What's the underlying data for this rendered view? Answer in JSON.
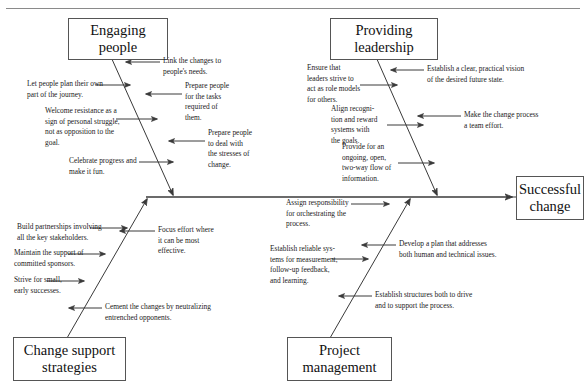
{
  "diagram": {
    "type": "fishbone-ishikawa",
    "effect": {
      "label": "Successful\nchange",
      "line1": "Successful",
      "line2": "change"
    },
    "categories": [
      {
        "id": "engaging-people",
        "label_line1": "Engaging",
        "label_line2": "people",
        "position": "top-left"
      },
      {
        "id": "providing-leadership",
        "label_line1": "Providing",
        "label_line2": "leadership",
        "position": "top-right"
      },
      {
        "id": "change-support-strategies",
        "label_line1": "Change support",
        "label_line2": "strategies",
        "position": "bottom-left"
      },
      {
        "id": "project-management",
        "label_line1": "Project",
        "label_line2": "management",
        "position": "bottom-right"
      }
    ],
    "causes": {
      "engaging_people": [
        "Link the changes to people's needs.",
        "Let people plan their own part of the journey.",
        "Prepare people for the tasks required of them.",
        "Welcome resistance as a sign of personal struggle, not as opposition to the goal.",
        "Prepare people to deal with the stresses of change.",
        "Celebrate progress and make it fun."
      ],
      "providing_leadership": [
        "Establish a clear, practical vision of the desired future state.",
        "Ensure that leaders strive to act as role models for others.",
        "Make the change process a team effort.",
        "Align recognition and reward systems with the goals.",
        "Provide for an ongoing, open, two-way flow of information."
      ],
      "change_support_strategies": [
        "Build partnerships involving all the key stakeholders.",
        "Focus effort where it can be most effective.",
        "Maintain the support of committed sponsors.",
        "Strive for small, early successes.",
        "Cement the changes by neutralizing entrenched opponents."
      ],
      "project_management": [
        "Assign responsibility for orchestrating the process.",
        "Develop a plan that addresses both human and technical issues.",
        "Establish reliable systems for measurement, follow-up feedback, and learning.",
        "Establish structures both to drive and to support the process."
      ]
    },
    "notes": {
      "engaging_people": [
        {
          "id": "ep-1",
          "text": "Link the changes to\npeople's needs.",
          "l1": "Link the changes to",
          "l2": "people's needs.",
          "l3": "",
          "l4": ""
        },
        {
          "id": "ep-2",
          "text": "Let people plan their own\npart of the journey.",
          "l1": "Let people plan their own",
          "l2": "part of the journey.",
          "l3": "",
          "l4": ""
        },
        {
          "id": "ep-3",
          "text": "Prepare people\nfor the tasks\nrequired of\nthem.",
          "l1": "Prepare people",
          "l2": "for the tasks",
          "l3": "required of",
          "l4": "them."
        },
        {
          "id": "ep-4",
          "text": "Welcome resistance as a\nsign of personal struggle,\nnot as opposition to the\ngoal.",
          "l1": "Welcome resistance as a",
          "l2": "sign of personal struggle,",
          "l3": "not as opposition to the",
          "l4": "goal."
        },
        {
          "id": "ep-5",
          "text": "Prepare people\nto deal with\nthe stresses of\nchange.",
          "l1": "Prepare people",
          "l2": "to deal with",
          "l3": "the stresses of",
          "l4": "change."
        },
        {
          "id": "ep-6",
          "text": "Celebrate progress and\nmake it fun.",
          "l1": "Celebrate progress and",
          "l2": "make it fun.",
          "l3": "",
          "l4": ""
        }
      ],
      "providing_leadership": [
        {
          "id": "pl-1",
          "text": "Establish a clear, practical vision\nof the desired future state.",
          "l1": "Establish a clear, practical vision",
          "l2": "of the desired future state.",
          "l3": "",
          "l4": ""
        },
        {
          "id": "pl-2",
          "text": "Ensure that\nleaders strive to\nact as role models\nfor others.",
          "l1": "Ensure that",
          "l2": "leaders strive to",
          "l3": "act as role models",
          "l4": "for others."
        },
        {
          "id": "pl-3",
          "text": "Make the change process\na team effort.",
          "l1": "Make the change process",
          "l2": "a team effort.",
          "l3": "",
          "l4": ""
        },
        {
          "id": "pl-4",
          "text": "Align recogni-\ntion and reward\nsystems with\nthe goals.",
          "l1": "Align recogni-",
          "l2": "tion and reward",
          "l3": "systems with",
          "l4": "the goals."
        },
        {
          "id": "pl-5",
          "text": "Provide for an\nongoing, open,\ntwo-way flow of\ninformation.",
          "l1": "Provide for an",
          "l2": "ongoing, open,",
          "l3": "two-way flow of",
          "l4": "information."
        }
      ],
      "change_support_strategies": [
        {
          "id": "cs-1",
          "text": "Build partnerships involving\nall the key stakeholders.",
          "l1": "Build partnerships involving",
          "l2": "all the key stakeholders.",
          "l3": "",
          "l4": ""
        },
        {
          "id": "cs-2",
          "text": "Focus effort where\nit can be most\neffective.",
          "l1": "Focus effort where",
          "l2": "it can be most",
          "l3": "effective.",
          "l4": ""
        },
        {
          "id": "cs-3",
          "text": "Maintain the support of\ncommitted sponsors.",
          "l1": "Maintain the support of",
          "l2": "committed sponsors.",
          "l3": "",
          "l4": ""
        },
        {
          "id": "cs-4",
          "text": "Strive for small,\nearly successes.",
          "l1": "Strive for small,",
          "l2": "early successes.",
          "l3": "",
          "l4": ""
        },
        {
          "id": "cs-5",
          "text": "Cement the changes by neutralizing\nentrenched opponents.",
          "l1": "Cement the changes by neutralizing",
          "l2": "entrenched opponents.",
          "l3": "",
          "l4": ""
        }
      ],
      "project_management": [
        {
          "id": "pm-1",
          "text": "Assign responsibility\nfor orchestrating the\nprocess.",
          "l1": "Assign responsibility",
          "l2": "for orchestrating the",
          "l3": "process.",
          "l4": ""
        },
        {
          "id": "pm-2",
          "text": "Develop a plan that addresses\nboth human and technical issues.",
          "l1": "Develop a plan that addresses",
          "l2": "both human and technical issues.",
          "l3": "",
          "l4": ""
        },
        {
          "id": "pm-3",
          "text": "Establish reliable sys-\ntems for measurement,\nfollow-up feedback,\nand learning.",
          "l1": "Establish reliable sys-",
          "l2": "tems for measurement,",
          "l3": "follow-up feedback,",
          "l4": "and learning."
        },
        {
          "id": "pm-4",
          "text": "Establish structures both to drive\nand to support the process.",
          "l1": "Establish structures both to drive",
          "l2": "and to support the process.",
          "l3": "",
          "l4": ""
        }
      ]
    },
    "colors": {
      "line": "#3a3a3a",
      "box_border": "#555555",
      "text": "#1a1a1a",
      "rule": "#8a8a8a",
      "background": "#ffffff"
    }
  }
}
